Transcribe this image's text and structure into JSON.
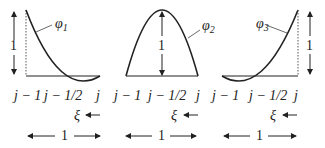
{
  "panels": [
    {
      "name": "phi1",
      "label": "φ",
      "subscript": "1",
      "height_label": "1",
      "x_labels": [
        "j − 1",
        "j − 1/2",
        "j"
      ],
      "xi_label": "ξ",
      "width_label": "1"
    },
    {
      "name": "phi2",
      "label": "φ",
      "subscript": "2",
      "height_label": "1",
      "x_labels": [
        "j − 1",
        "j − 1/2",
        "j"
      ],
      "xi_label": "ξ",
      "width_label": "1"
    },
    {
      "name": "phi3",
      "label": "φ",
      "subscript": "3",
      "height_label": "1",
      "x_labels": [
        "j − 1",
        "j − 1/2",
        "j"
      ],
      "xi_label": "ξ",
      "width_label": "1"
    }
  ],
  "colors": {
    "ink": "#222222",
    "background": "#ffffff"
  }
}
